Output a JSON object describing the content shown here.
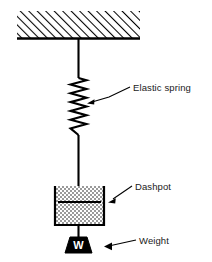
{
  "figure": {
    "background_color": "#ffffff",
    "line_color": "#000000",
    "width": 212,
    "height": 262
  },
  "ceiling": {
    "name": "Fixed support / ceiling",
    "hatch_style": "diagonal-45-up-right",
    "hatch_color": "#000000",
    "x": 17,
    "y": 11,
    "width": 123,
    "height": 27,
    "baseline_y": 38
  },
  "rods": {
    "upper_rod": {
      "x": 78.5,
      "y1": 38,
      "y2": 78
    },
    "lower_rod": {
      "x": 78.5,
      "y1": 135,
      "y2": 202
    },
    "piston_rod": {
      "x": 78.5,
      "y1": 186,
      "y2": 202
    },
    "weight_rod": {
      "x": 78.5,
      "y1": 225,
      "y2": 237
    }
  },
  "spring": {
    "name": "Elastic spring",
    "x_center": 78.5,
    "y_top": 78,
    "y_bottom": 135,
    "amplitude": 8,
    "coils": 6
  },
  "dashpot": {
    "name": "Dashpot",
    "x": 55,
    "y": 186,
    "width": 49,
    "height": 39,
    "fill_pattern": "stipple-dots",
    "fill_color": "#7a7a7a",
    "piston": {
      "x1": 58,
      "x2": 101,
      "y": 202
    }
  },
  "weight": {
    "name": "Weight",
    "glyph": "W",
    "fill_color": "#000000",
    "top_x1": 70,
    "top_x2": 87,
    "bottom_x1": 65,
    "bottom_x2": 92,
    "y_top": 237,
    "y_bottom": 253
  },
  "annotations": [
    {
      "id": "spring",
      "label": "Elastic spring",
      "text_x": 133,
      "text_y": 92,
      "leader": "M 130 88 L 110 97 L 90 102",
      "arrow_x": 87,
      "arrow_y": 103,
      "arrow_dir": "left-down"
    },
    {
      "id": "dashpot",
      "label": "Dashpot",
      "text_x": 135,
      "text_y": 190,
      "leader": "M 132 187 L 112 199",
      "arrow_x": 108,
      "arrow_y": 201,
      "arrow_dir": "left-down"
    },
    {
      "id": "weight",
      "label": "Weight",
      "text_x": 138,
      "text_y": 243,
      "leader": "M 136 240 L 112 245",
      "arrow_x": 108,
      "arrow_y": 246,
      "arrow_dir": "left"
    }
  ]
}
